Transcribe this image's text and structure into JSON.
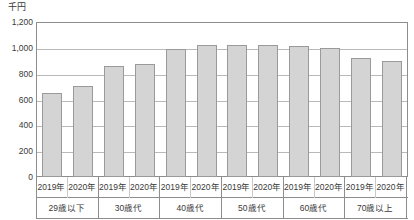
{
  "unit_label": "千円",
  "chart_data": {
    "type": "bar",
    "title": "",
    "subtitle": "",
    "xlabel": "",
    "ylabel": "千円",
    "ylim": [
      0,
      1200
    ],
    "y_ticks": [
      "0",
      "200",
      "400",
      "600",
      "800",
      "1,000",
      "1,200"
    ],
    "y_tick_values": [
      0,
      200,
      400,
      600,
      800,
      1000,
      1200
    ],
    "grid": true,
    "legend": "none",
    "categories": [
      "29歳以下",
      "30歳代",
      "40歳代",
      "50歳代",
      "60歳代",
      "70歳以上"
    ],
    "subcategories": [
      "2019年",
      "2020年"
    ],
    "series": [
      {
        "name": "2019年",
        "values": [
          650,
          860,
          990,
          1020,
          1015,
          920
        ]
      },
      {
        "name": "2020年",
        "values": [
          705,
          875,
          1020,
          1025,
          1000,
          895
        ]
      }
    ],
    "bars": [
      {
        "group": "29歳以下",
        "year": "2019年",
        "value": 650
      },
      {
        "group": "29歳以下",
        "year": "2020年",
        "value": 705
      },
      {
        "group": "30歳代",
        "year": "2019年",
        "value": 860
      },
      {
        "group": "30歳代",
        "year": "2020年",
        "value": 875
      },
      {
        "group": "40歳代",
        "year": "2019年",
        "value": 990
      },
      {
        "group": "40歳代",
        "year": "2020年",
        "value": 1020
      },
      {
        "group": "50歳代",
        "year": "2019年",
        "value": 1020
      },
      {
        "group": "50歳代",
        "year": "2020年",
        "value": 1025
      },
      {
        "group": "60歳代",
        "year": "2019年",
        "value": 1015
      },
      {
        "group": "60歳代",
        "year": "2020年",
        "value": 1000
      },
      {
        "group": "70歳以上",
        "year": "2019年",
        "value": 920
      },
      {
        "group": "70歳以上",
        "year": "2020年",
        "value": 895
      }
    ],
    "colors": {
      "bar_fill": "#d4d4d4",
      "bar_stroke": "#9a9a9a",
      "gridline": "#b9b9b9",
      "axis": "#8d8d8d",
      "text": "#3a3a3a",
      "background": "#ffffff"
    }
  }
}
